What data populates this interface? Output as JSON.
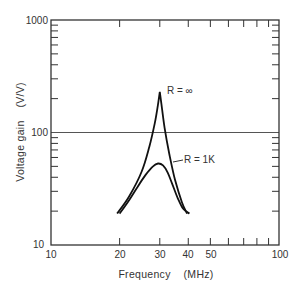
{
  "chart_data": {
    "type": "line",
    "title": "",
    "xlabel": "Frequency    (MHz)",
    "ylabel": "Voltage gain    (V/V)",
    "xscale": "log",
    "yscale": "log",
    "xlim": [
      10,
      100
    ],
    "ylim": [
      10,
      1000
    ],
    "x_tick_labels": [
      "10",
      "20",
      "30",
      "40",
      "50",
      "100"
    ],
    "y_tick_labels": [
      "10",
      "100",
      "1000"
    ],
    "grid": "horizontal line at 100",
    "series": [
      {
        "name": "R = ∞",
        "points": [
          [
            19.5,
            19
          ],
          [
            22,
            27
          ],
          [
            25,
            45
          ],
          [
            27,
            75
          ],
          [
            28.5,
            120
          ],
          [
            29.5,
            180
          ],
          [
            30,
            230
          ],
          [
            30.5,
            180
          ],
          [
            31.5,
            110
          ],
          [
            33,
            65
          ],
          [
            35,
            38
          ],
          [
            37.5,
            24
          ],
          [
            39.5,
            19
          ]
        ]
      },
      {
        "name": "R = 1K",
        "points": [
          [
            20,
            19
          ],
          [
            22,
            25
          ],
          [
            24,
            33
          ],
          [
            26,
            42
          ],
          [
            28,
            50
          ],
          [
            29.5,
            53
          ],
          [
            31,
            51
          ],
          [
            32.5,
            44
          ],
          [
            34,
            35
          ],
          [
            36,
            26
          ],
          [
            38,
            21
          ],
          [
            40.5,
            19
          ]
        ]
      }
    ],
    "annotations": [
      {
        "text": "R = ∞",
        "x": 31,
        "y": 230
      },
      {
        "text": "R = 1K",
        "x": 33.5,
        "y": 55
      }
    ]
  },
  "labels": {
    "y_title": "Voltage gain    (V/V)",
    "x_title": "Frequency    (MHz)",
    "y1000": "1000",
    "y100": "100",
    "y10": "10",
    "x10": "10",
    "x20": "20",
    "x30": "30",
    "x40": "40",
    "x50": "50",
    "x100": "100",
    "ann_inf": "R = ∞",
    "ann_1k": "R = 1K"
  }
}
